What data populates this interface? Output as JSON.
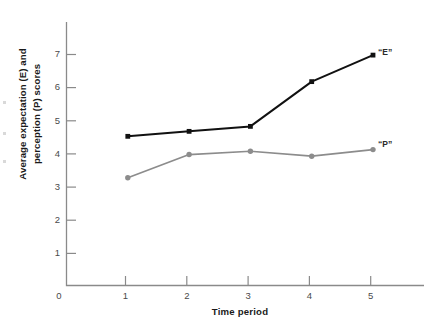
{
  "chart_data": {
    "type": "line",
    "title": "",
    "xlabel": "Time period",
    "ylabel": "Average expectation (E) and perception (P) scores",
    "ylabel_lines": [
      "Average expectation (E) and",
      "perception (P) scores"
    ],
    "categories": [
      "1",
      "2",
      "3",
      "4",
      "5"
    ],
    "x": [
      1,
      2,
      3,
      4,
      5
    ],
    "xlim": [
      0,
      5.9
    ],
    "ylim": [
      0,
      7.9
    ],
    "xticks": [
      "1",
      "2",
      "3",
      "4",
      "5"
    ],
    "yticks": [
      "1",
      "2",
      "3",
      "4",
      "5",
      "6",
      "7"
    ],
    "origin_label": "0",
    "grid": false,
    "legend": "inline-end-labels",
    "series": [
      {
        "name": "“E”",
        "label": "“E”",
        "color": "#111111",
        "marker": "square",
        "values": [
          4.5,
          4.65,
          4.8,
          6.15,
          6.95
        ]
      },
      {
        "name": "“P”",
        "label": "“P”",
        "color": "#8c8c8c",
        "marker": "circle",
        "values": [
          3.25,
          3.95,
          4.05,
          3.9,
          4.1
        ]
      }
    ]
  },
  "axis": {
    "x_title": "Time period",
    "y_title_line1": "Average expectation (E) and",
    "y_title_line2": "perception (P) scores",
    "origin": "0"
  },
  "colors": {
    "axis": "#8a8a8a",
    "series_e": "#111111",
    "series_p": "#8c8c8c",
    "background": "#ffffff",
    "tick_text": "#4a4a4a"
  }
}
